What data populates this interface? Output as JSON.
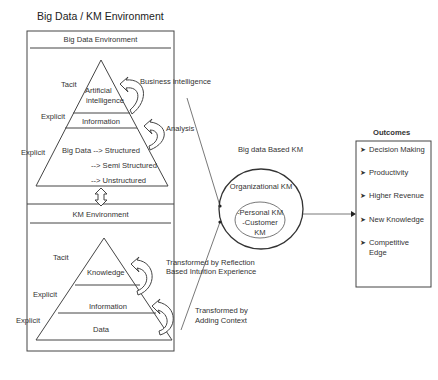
{
  "title": "Big Data / KM Environment",
  "big_data_env": {
    "header": "Big Data Environment",
    "pyramid": {
      "top": [
        "Artificial",
        "intelligence"
      ],
      "middle": "Information",
      "bottom_lines": [
        "Big Data --> Structured",
        "--> Semi Structured",
        "--> Unstructured"
      ]
    },
    "side_labels": {
      "tacit": "Tacit",
      "explicit_mid": "Explicit",
      "explicit_outer": "Explicit"
    },
    "arrows": {
      "upper": "Business intelligence",
      "lower": "Analysis"
    }
  },
  "km_env": {
    "header": "KM Environment",
    "pyramid": {
      "top": "Knowledge",
      "middle": "Information",
      "bottom": "Data"
    },
    "side_labels": {
      "tacit": "Tacit",
      "explicit_mid": "Explicit",
      "explicit_outer": "Explicit"
    },
    "arrows": {
      "upper": [
        "Transformed by Reflection",
        "Based Intuition Experience"
      ],
      "lower": [
        "Transformed by",
        "Adding Context"
      ]
    }
  },
  "big_data_km": {
    "title": "Big data Based KM",
    "outer": "Organizational KM",
    "inner": [
      "-Personal KM",
      "-Customer",
      "KM"
    ]
  },
  "outcomes": {
    "title": "Outcomes",
    "items": [
      "Decision Making",
      "Productivity",
      "Higher Revenue",
      "New Knowledge",
      "Competitive",
      "Edge"
    ]
  }
}
